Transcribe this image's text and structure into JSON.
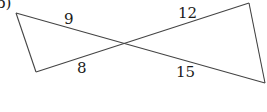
{
  "figure": {
    "part_label": "b)",
    "colors": {
      "line": "#444444",
      "text": "#1a1a1a",
      "background": "#ffffff"
    },
    "vertices": {
      "top_left": [
        16,
        13
      ],
      "bottom_left": [
        36,
        72
      ],
      "intersection": [
        124,
        44
      ],
      "top_right": [
        249,
        3
      ],
      "bottom_right": [
        265,
        83
      ]
    },
    "segment_labels": [
      {
        "id": "left-upper",
        "value": "9"
      },
      {
        "id": "left-lower",
        "value": "8"
      },
      {
        "id": "right-upper",
        "value": "12"
      },
      {
        "id": "right-lower",
        "value": "15"
      }
    ]
  }
}
